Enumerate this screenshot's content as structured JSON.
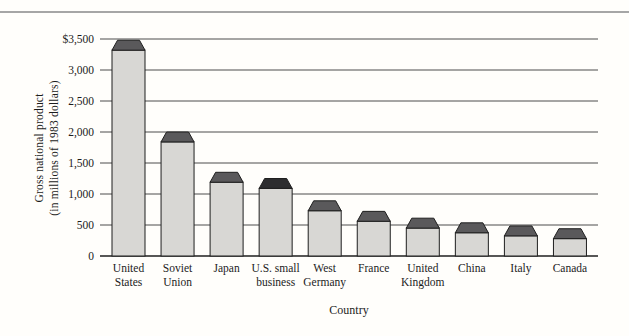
{
  "figure": {
    "xlabel": "Country",
    "ylabel_lines": [
      "Gross national product",
      "(in millions of 1983 dollars)"
    ]
  },
  "chart_data": {
    "type": "bar",
    "title": "",
    "xlabel": "Country",
    "ylabel": "Gross national product (in millions of 1983 dollars)",
    "categories": [
      "United States",
      "Soviet Union",
      "Japan",
      "U.S. small business",
      "West Germany",
      "France",
      "United Kingdom",
      "China",
      "Italy",
      "Canada"
    ],
    "category_lines": [
      [
        "United",
        "States"
      ],
      [
        "Soviet",
        "Union"
      ],
      [
        "Japan"
      ],
      [
        "U.S. small",
        "business"
      ],
      [
        "West",
        "Germany"
      ],
      [
        "France"
      ],
      [
        "United",
        "Kingdom"
      ],
      [
        "China"
      ],
      [
        "Italy"
      ],
      [
        "Canada"
      ]
    ],
    "values": [
      3480,
      2000,
      1350,
      1250,
      890,
      720,
      610,
      535,
      485,
      440
    ],
    "cap_height": 160,
    "highlight_index": 3,
    "ylim": [
      0,
      3500
    ],
    "yticks": [
      0,
      500,
      1000,
      1500,
      2000,
      2500,
      3000,
      3500
    ],
    "ytick_labels": [
      "0",
      "500",
      "1,000",
      "1,500",
      "2,000",
      "2,500",
      "3,000",
      "$3,500"
    ],
    "grid": true,
    "legend": false,
    "colors": {
      "background": "#fffefb",
      "bar_fill": "#d8d7d4",
      "bar_edge": "#1f1f1f",
      "cap_fill": "#5a595b",
      "cap_fill_highlight": "#2d2d2f",
      "gridline": "#4d4d4d",
      "axis": "#1f1f1f",
      "top_rule": "#a6a6a6"
    }
  }
}
